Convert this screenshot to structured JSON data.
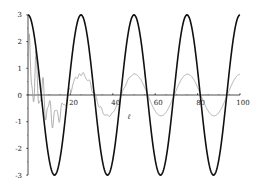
{
  "chart_data": {
    "type": "line",
    "title": "",
    "xlabel": "",
    "ylabel": "",
    "xlim": [
      0,
      100
    ],
    "ylim": [
      -3,
      3
    ],
    "grid": false,
    "legend": null,
    "x_ticks": [
      "20",
      "40",
      "60",
      "80",
      "100"
    ],
    "y_ticks": [
      "3",
      "2",
      "1",
      "0",
      "-1",
      "-2",
      "-3"
    ],
    "series": [
      {
        "name": "reference",
        "style": "thick black",
        "color": "#111111",
        "function": "3*cos(2*pi*t/25)",
        "x": [
          0,
          6.25,
          12.5,
          18.75,
          25,
          31.25,
          37.5,
          43.75,
          50,
          56.25,
          62.5,
          68.75,
          75,
          81.25,
          87.5,
          93.75,
          100
        ],
        "values": [
          3,
          0,
          -3,
          0,
          3,
          0,
          -3,
          0,
          3,
          0,
          -3,
          0,
          3,
          0,
          -3,
          0,
          3
        ]
      },
      {
        "name": "response",
        "style": "thin grey",
        "color": "#888888",
        "description": "noisy transient decaying to a steady sinusoid of amplitude ~0.8 with same period",
        "x": [
          0,
          2,
          4,
          6,
          8,
          10,
          12,
          14,
          16,
          18,
          20,
          25,
          30,
          35,
          40,
          45,
          50,
          55,
          60,
          65,
          70,
          75,
          80,
          85,
          90,
          95,
          100
        ],
        "values": [
          0,
          1.5,
          -0.6,
          0.8,
          -0.4,
          -0.9,
          -1.2,
          -0.5,
          -1.1,
          -0.2,
          0.3,
          0.8,
          0.1,
          -0.7,
          -0.6,
          0.1,
          0.8,
          0.3,
          -0.7,
          -0.5,
          0.3,
          0.8,
          0.2,
          -0.7,
          -0.6,
          0.3,
          0.7
        ]
      }
    ],
    "annotations": [
      {
        "text": "ℓ",
        "x": 47,
        "y": -0.9
      }
    ]
  }
}
